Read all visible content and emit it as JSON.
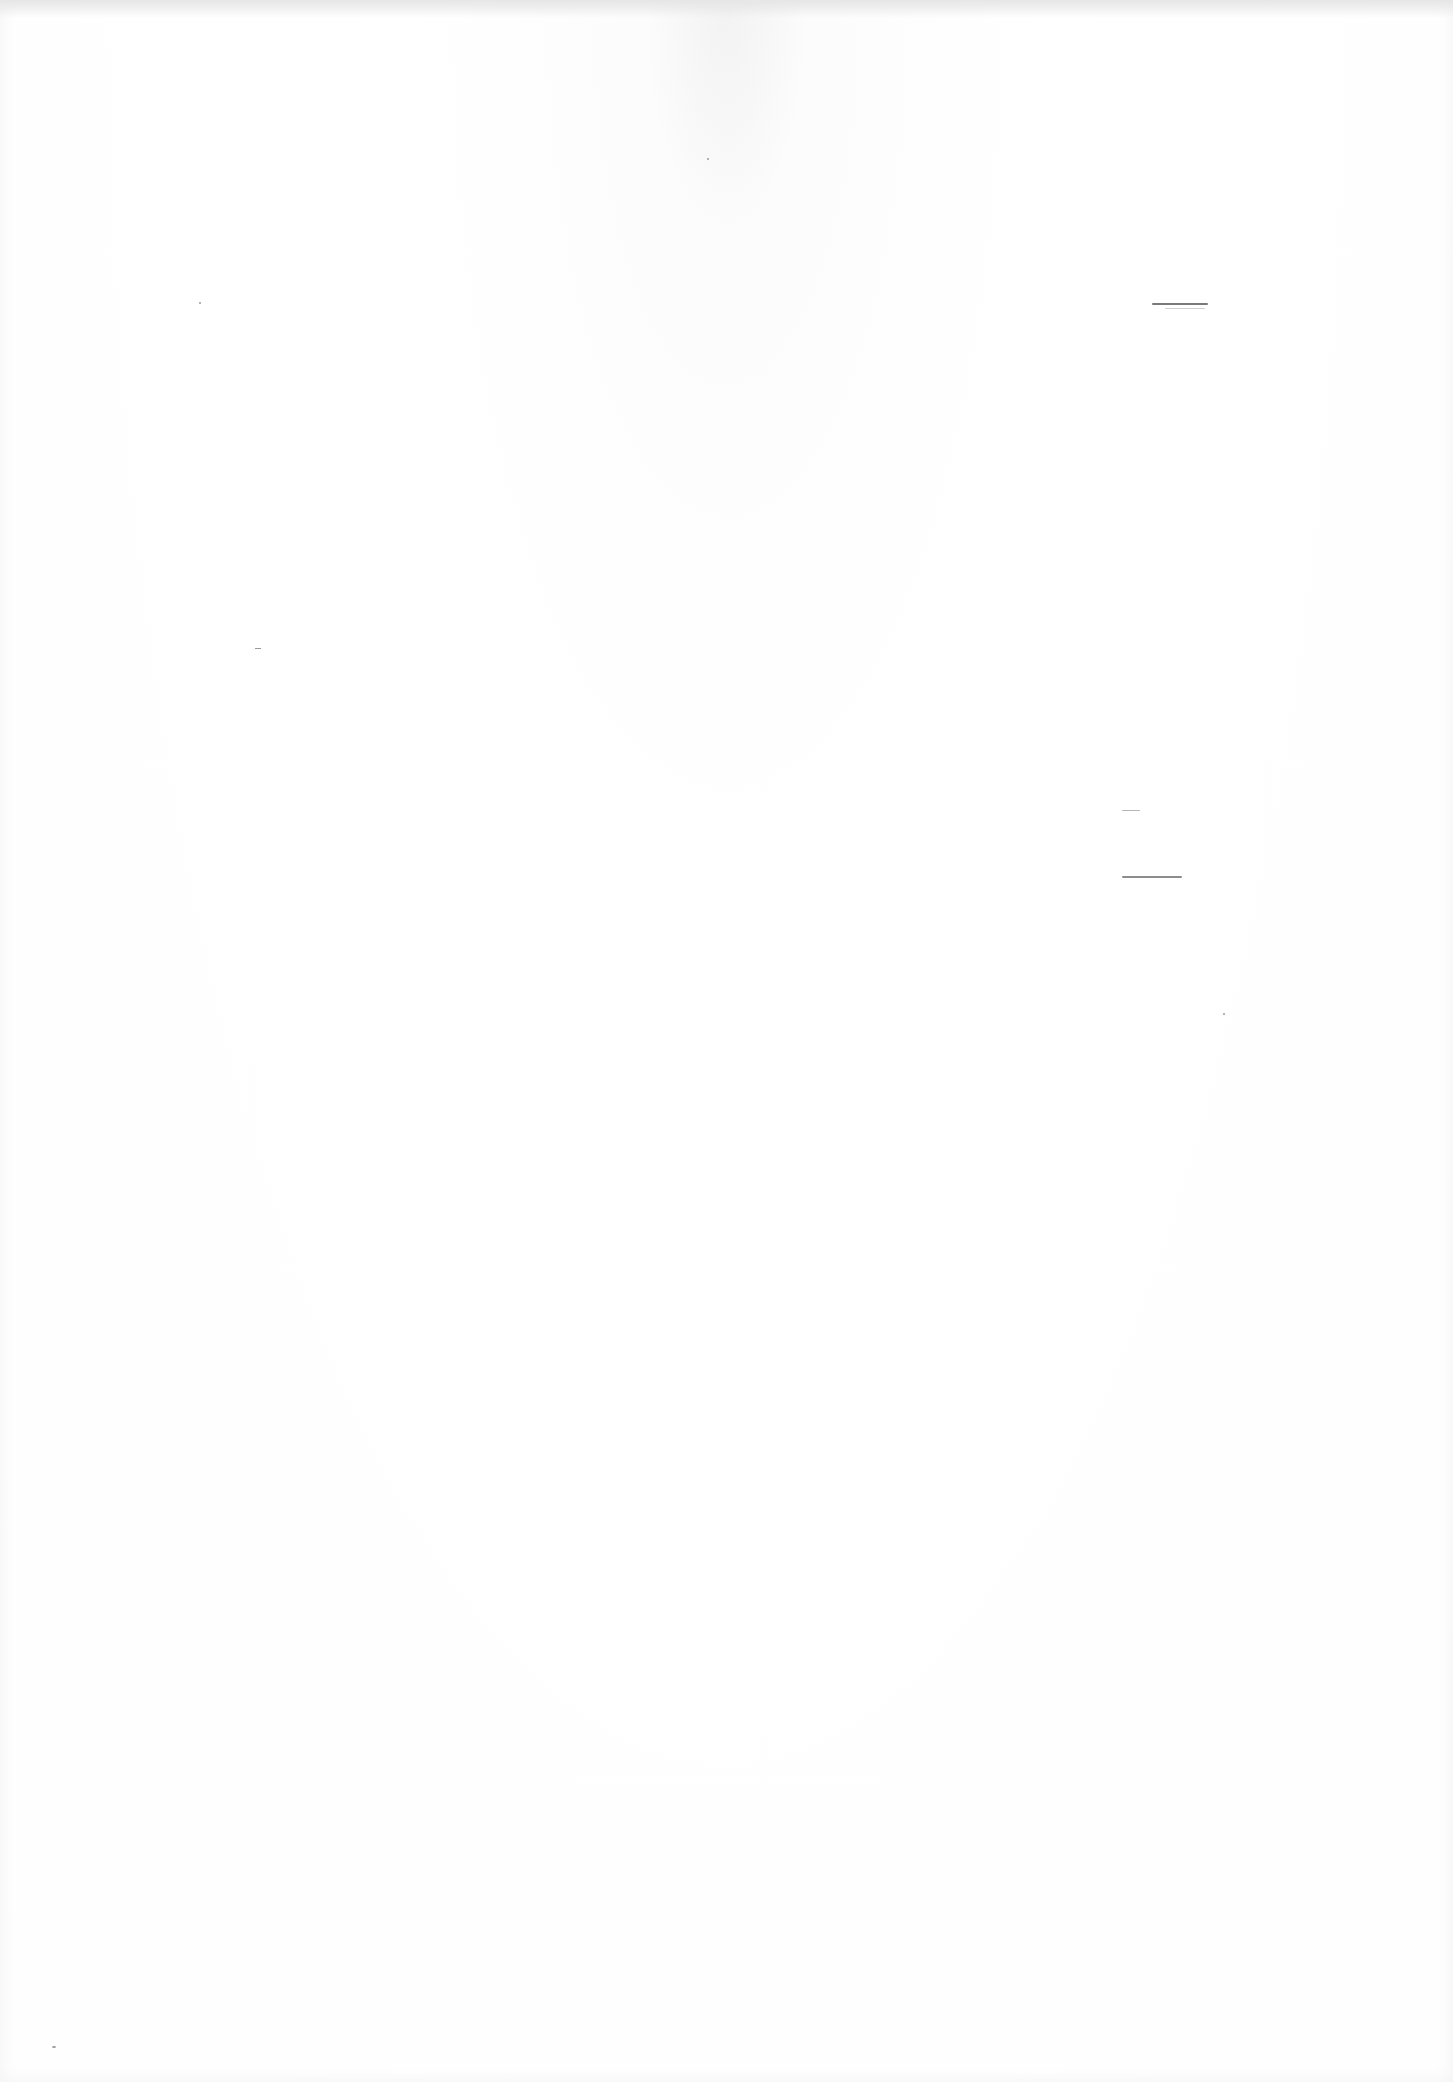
{
  "document": {
    "type": "blank scanned page",
    "bleed_through_text": "",
    "visible_text": []
  },
  "marks": [
    {
      "kind": "pencil-line",
      "approx_position": "right margin, upper third"
    },
    {
      "kind": "short-dash",
      "approx_position": "right side, middle"
    },
    {
      "kind": "pencil-line",
      "approx_position": "right side, middle"
    }
  ],
  "colors": {
    "paper": "#fefefe",
    "mark": "#8a8a8a"
  }
}
